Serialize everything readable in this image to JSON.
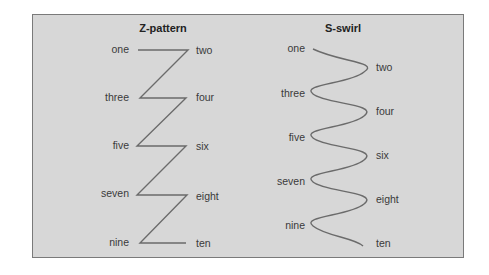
{
  "panels": [
    {
      "title": "Z-pattern",
      "left_labels": [
        "one",
        "three",
        "five",
        "seven",
        "nine"
      ],
      "right_labels": [
        "two",
        "four",
        "six",
        "eight",
        "ten"
      ]
    },
    {
      "title": "S-swirl",
      "left_labels": [
        "one",
        "three",
        "five",
        "seven",
        "nine"
      ],
      "right_labels": [
        "two",
        "four",
        "six",
        "eight",
        "ten"
      ]
    }
  ],
  "colors": {
    "background": "#d7d7d7",
    "line": "#6b6b6b",
    "text": "#3a3a3a"
  }
}
